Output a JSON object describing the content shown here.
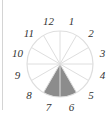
{
  "diagram": {
    "type": "clock-fraction-circle",
    "segments": 12,
    "shaded_segments": [
      6,
      7
    ],
    "shade_color": "#8c8c8c",
    "line_color": "#dedede",
    "labels": [
      "12",
      "1",
      "2",
      "3",
      "4",
      "5",
      "6",
      "7",
      "8",
      "9",
      "10",
      "11"
    ]
  }
}
